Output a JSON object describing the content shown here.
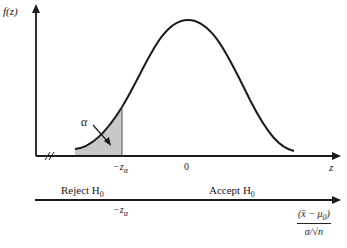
{
  "figure": {
    "y_axis_label": "f(z)",
    "x_axis_label": "z",
    "alpha_label": "α",
    "critical_label": "−z",
    "critical_sub": "α",
    "zero_label": "0",
    "reject_label": "Reject H",
    "reject_sub": "0",
    "accept_label": "Accept H",
    "accept_sub": "0",
    "statistic_numerator": "(x̄ − μ",
    "statistic_numerator_sub": "0",
    "statistic_numerator_close": ")",
    "statistic_denominator": "σ/√n",
    "lower_critical_label": "−z",
    "lower_critical_sub": "α"
  },
  "colors": {
    "line": "#1a1a1a",
    "shade": "#c8c8c8"
  }
}
